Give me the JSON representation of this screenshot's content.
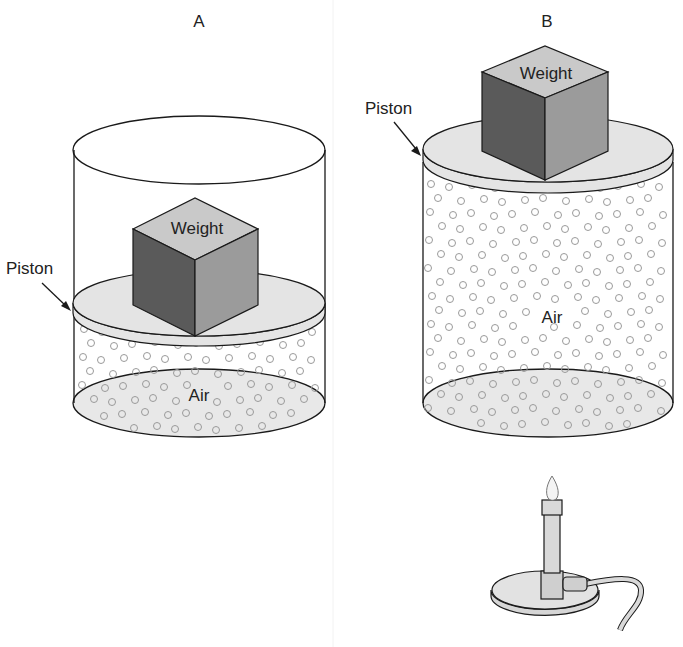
{
  "panels": {
    "a": {
      "title": "A",
      "weight_label": "Weight",
      "piston_label": "Piston",
      "gas_label": "Air"
    },
    "b": {
      "title": "B",
      "weight_label": "Weight",
      "piston_label": "Piston",
      "gas_label": "Air"
    }
  },
  "colors": {
    "outline": "#1a1a1a",
    "piston_fill": "#e4e4e4",
    "base_fill": "#e8e8e8",
    "cube_top": "#c9c9c9",
    "cube_left": "#5a5a5a",
    "cube_right": "#9b9b9b",
    "molecule": "#9a9a9a"
  },
  "heat_source": {
    "icon": "bunsen-burner-icon"
  }
}
